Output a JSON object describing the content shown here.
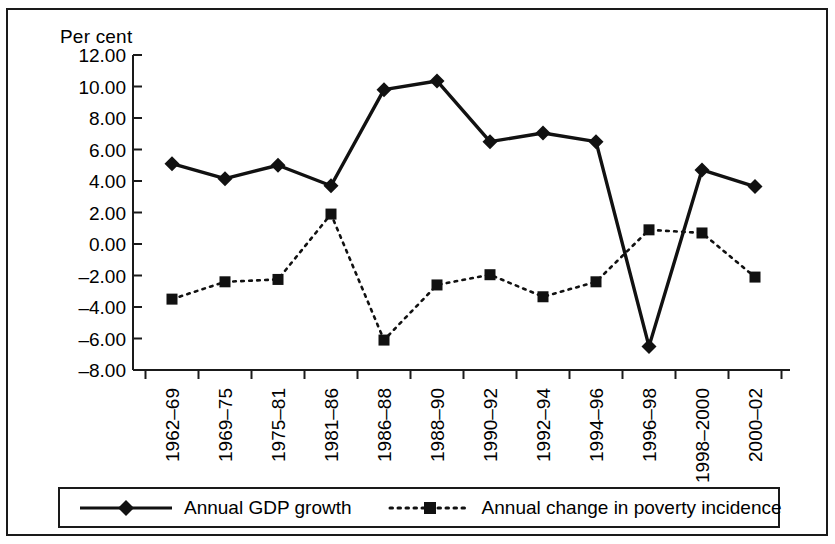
{
  "figure": {
    "y_axis_caption": "Per cent"
  },
  "chart_data": {
    "type": "line",
    "title": "",
    "subtitle": "",
    "xlabel": "",
    "ylabel": "Per cent",
    "ylim": [
      -8.0,
      12.0
    ],
    "y_tick_step": 2.0,
    "y_ticks": [
      12.0,
      10.0,
      8.0,
      6.0,
      4.0,
      2.0,
      0.0,
      -2.0,
      -4.0,
      -6.0,
      -8.0
    ],
    "y_tick_labels": [
      "12.00",
      "10.00",
      "8.00",
      "6.00",
      "4.00",
      "2.00",
      "0.00",
      "–2.00",
      "–4.00",
      "–6.00",
      "–8.00"
    ],
    "grid": false,
    "legend_position": "bottom",
    "categories": [
      "1962–69",
      "1969–75",
      "1975–81",
      "1981–86",
      "1986–88",
      "1988–90",
      "1990–92",
      "1992–94",
      "1994–96",
      "1996–98",
      "1998–2000",
      "2000–02"
    ],
    "series": [
      {
        "name": "Annual GDP growth",
        "marker": "diamond",
        "line_style": "solid",
        "color": "#111111",
        "values": [
          5.1,
          4.15,
          5.0,
          3.7,
          9.8,
          10.35,
          6.5,
          7.05,
          6.5,
          -6.5,
          4.7,
          3.65
        ]
      },
      {
        "name": "Annual change in poverty incidence",
        "marker": "square",
        "line_style": "dotted",
        "color": "#111111",
        "values": [
          -3.5,
          -2.4,
          -2.25,
          1.9,
          -6.1,
          -2.6,
          -1.95,
          -3.35,
          -2.4,
          0.9,
          0.7,
          -2.1
        ]
      }
    ]
  },
  "legend": {
    "items": [
      {
        "label": "Annual GDP growth",
        "marker": "diamond",
        "line_style": "solid"
      },
      {
        "label": "Annual change in poverty incidence",
        "marker": "square",
        "line_style": "dotted"
      }
    ]
  }
}
